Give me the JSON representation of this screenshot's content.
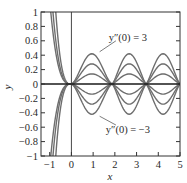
{
  "chart_data": {
    "type": "line",
    "title": "",
    "xlabel": "x",
    "ylabel": "y",
    "xlim": [
      -1.4,
      5
    ],
    "ylim": [
      -1,
      1
    ],
    "grid": false,
    "legend": null,
    "x_ticks": [
      -1,
      0,
      1,
      2,
      3,
      4,
      5
    ],
    "x_tick_labels": [
      "−1",
      "0",
      "1",
      "2",
      "3",
      "4",
      "5"
    ],
    "y_ticks": [
      1,
      0.8,
      0.6,
      0.4,
      0.2,
      0,
      -0.2,
      -0.4,
      -0.6,
      -0.8,
      -1
    ],
    "y_tick_labels": [
      "1",
      "0.8",
      "0.6",
      "0.4",
      "0.2",
      "0",
      "−0.2",
      "−0.4",
      "−0.6",
      "−0.8",
      "−1"
    ],
    "zero_crossings_x": [
      0,
      1.88,
      3.44,
      5.0
    ],
    "series": [
      {
        "name": "y''(0) = 3",
        "peak_amplitude": 0.42,
        "left_exit_x": -0.72
      },
      {
        "name": "y''(0) = 2",
        "peak_amplitude": 0.28,
        "left_exit_x": -0.85
      },
      {
        "name": "y''(0) = 1",
        "peak_amplitude": 0.14,
        "left_exit_x": -0.95
      },
      {
        "name": "y''(0) = 0",
        "peak_amplitude": 0.0,
        "left_exit_x": null
      },
      {
        "name": "y''(0) = -1",
        "peak_amplitude": -0.14,
        "left_exit_x": -0.95
      },
      {
        "name": "y''(0) = -2",
        "peak_amplitude": -0.28,
        "left_exit_x": -0.85
      },
      {
        "name": "y''(0) = -3",
        "peak_amplitude": -0.42,
        "left_exit_x": -0.72
      }
    ],
    "annotations": [
      {
        "text": "y''(0) = 3",
        "points_to_series": "y''(0) = 3",
        "label_xy": [
          2.6,
          0.65
        ],
        "arrow_to": [
          1.3,
          0.42
        ]
      },
      {
        "text": "y''(0) = −3",
        "points_to_series": "y''(0) = -3",
        "label_xy": [
          2.6,
          -0.62
        ],
        "arrow_to": [
          1.3,
          -0.42
        ]
      }
    ]
  },
  "labels": {
    "xlabel": "x",
    "ylabel": "y",
    "annot_top": "y″(0) = 3",
    "annot_bottom": "y″(0) = −3"
  },
  "colors": {
    "curve": "#6e6e6e",
    "axis": "#333333",
    "zero_line": "#1a1a1a"
  }
}
